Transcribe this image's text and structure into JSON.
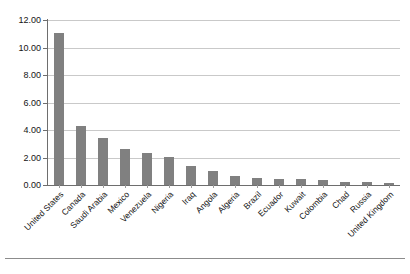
{
  "chart_data": {
    "type": "bar",
    "title": "",
    "subtitle": "",
    "xlabel": "",
    "ylabel": "",
    "ylim": [
      0,
      12
    ],
    "ytick_step": 2,
    "grid": true,
    "legend": false,
    "orientation": "vertical",
    "bar_color": "#808080",
    "gridline_color": "#c9c9c9",
    "axis_color": "#6e6e6e",
    "label_rotation_deg": -45,
    "ytick_labels": [
      "0.00",
      "2.00",
      "4.00",
      "6.00",
      "8.00",
      "10.00",
      "12.00"
    ],
    "ytick_values": [
      0,
      2,
      4,
      6,
      8,
      10,
      12
    ],
    "categories": [
      "United States",
      "Canada",
      "Saudi Arabia",
      "Mexico",
      "Venezuela",
      "Nigeria",
      "Iraq",
      "Angola",
      "Algeria",
      "Brazil",
      "Ecuador",
      "Kuwait",
      "Colombia",
      "Chad",
      "Russia",
      "United Kingdom"
    ],
    "values": [
      11.05,
      4.3,
      3.4,
      2.65,
      2.35,
      2.05,
      1.4,
      1.0,
      0.65,
      0.5,
      0.45,
      0.45,
      0.35,
      0.25,
      0.2,
      0.15
    ]
  }
}
